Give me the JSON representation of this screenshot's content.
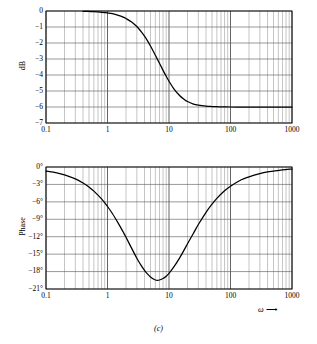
{
  "figure": {
    "caption": "(c)",
    "xlabel": "ω",
    "xlabel_arrow": "⟶"
  },
  "chart_data": [
    {
      "type": "line",
      "id": "magnitude",
      "title": "",
      "xlabel": "ω",
      "ylabel": "dB",
      "xscale": "log",
      "xlim": [
        0.1,
        1000
      ],
      "ylim": [
        -7,
        0
      ],
      "grid": true,
      "legend": null,
      "xticks": [
        0.1,
        1,
        10,
        100,
        1000
      ],
      "xticklabels": [
        "0.1",
        "1",
        "10",
        "100",
        "1000"
      ],
      "yticks": [
        0,
        -1,
        -2,
        -3,
        -4,
        -5,
        -6,
        -7
      ],
      "yticklabels": [
        "0",
        "−1",
        "−2",
        "−3",
        "−4",
        "−5",
        "−6",
        "−7"
      ],
      "series": [
        {
          "name": "Magnitude",
          "x": [
            0.4,
            0.5,
            0.6,
            0.7,
            0.8,
            0.9,
            1.0,
            1.2,
            1.5,
            1.8,
            2.0,
            2.5,
            3.0,
            3.5,
            4.0,
            4.5,
            5.0,
            5.5,
            6.0,
            7.0,
            8.0,
            9.0,
            10.0,
            12.0,
            15.0,
            18.0,
            20.0,
            25.0,
            30.0,
            40.0,
            50.0,
            60.0,
            70.0,
            80.0,
            100.0,
            150.0,
            200.0,
            300.0,
            500.0,
            700.0,
            1000.0
          ],
          "y": [
            -0.02,
            -0.03,
            -0.04,
            -0.06,
            -0.08,
            -0.1,
            -0.12,
            -0.17,
            -0.27,
            -0.38,
            -0.47,
            -0.7,
            -0.97,
            -1.27,
            -1.57,
            -1.88,
            -2.19,
            -2.48,
            -2.76,
            -3.27,
            -3.71,
            -4.08,
            -4.39,
            -4.86,
            -5.3,
            -5.55,
            -5.66,
            -5.82,
            -5.89,
            -5.95,
            -5.97,
            -5.98,
            -5.99,
            -5.99,
            -6.0,
            -6.0,
            -6.0,
            -6.0,
            -6.0,
            -6.0,
            -6.0
          ]
        }
      ]
    },
    {
      "type": "line",
      "id": "phase",
      "title": "",
      "xlabel": "ω",
      "ylabel": "Phase",
      "xscale": "log",
      "xlim": [
        0.1,
        1000
      ],
      "ylim": [
        -21,
        0
      ],
      "grid": true,
      "legend": null,
      "xticks": [
        0.1,
        1,
        10,
        100,
        1000
      ],
      "xticklabels": [
        "0.1",
        "1",
        "10",
        "100",
        "1000"
      ],
      "yticks": [
        0,
        -3,
        -6,
        -9,
        -12,
        -15,
        -18,
        -21
      ],
      "yticklabels": [
        "0°",
        "−3°",
        "−6°",
        "−9°",
        "−12°",
        "−15°",
        "−18°",
        "−21°"
      ],
      "series": [
        {
          "name": "Phase",
          "x": [
            0.1,
            0.15,
            0.2,
            0.3,
            0.4,
            0.5,
            0.6,
            0.8,
            1.0,
            1.2,
            1.5,
            1.8,
            2.0,
            2.5,
            3.0,
            3.5,
            4.0,
            4.5,
            5.0,
            5.5,
            6.0,
            6.5,
            7.0,
            8.0,
            9.0,
            10.0,
            12.0,
            15.0,
            18.0,
            20.0,
            25.0,
            30.0,
            40.0,
            50.0,
            60.0,
            80.0,
            100.0,
            150.0,
            200.0,
            300.0,
            400.0,
            500.0,
            700.0,
            1000.0
          ],
          "y": [
            -0.7,
            -1.0,
            -1.35,
            -2.05,
            -2.75,
            -3.45,
            -4.15,
            -5.5,
            -6.8,
            -8.0,
            -9.7,
            -11.2,
            -12.1,
            -14.1,
            -15.7,
            -16.9,
            -17.8,
            -18.45,
            -18.95,
            -19.25,
            -19.45,
            -19.5,
            -19.45,
            -19.2,
            -18.8,
            -18.3,
            -17.2,
            -15.6,
            -14.1,
            -13.2,
            -11.4,
            -9.9,
            -7.8,
            -6.4,
            -5.4,
            -4.1,
            -3.3,
            -2.2,
            -1.7,
            -1.15,
            -0.85,
            -0.7,
            -0.5,
            -0.35
          ]
        }
      ]
    }
  ]
}
